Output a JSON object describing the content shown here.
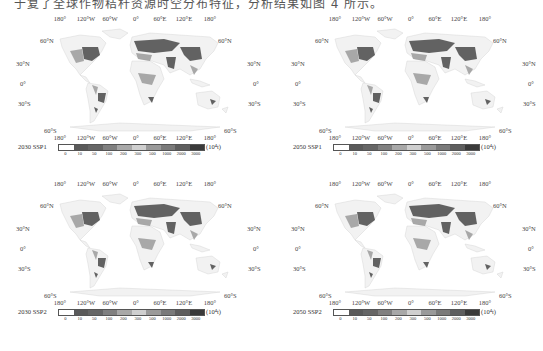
{
  "caption": "于复了全球作物秸秆资源时空分布特征，分析结果如图 4 所示。",
  "lon_labels": [
    "180°",
    "120°W",
    "60°W",
    "0°",
    "60°E",
    "120°E",
    "180°"
  ],
  "lat_labels": [
    "60°N",
    "30°N",
    "0°",
    "30°S",
    "60°S"
  ],
  "legend": {
    "ticks": [
      "0",
      "10",
      "50",
      "100",
      "200",
      "300",
      "500",
      "1000",
      "2000",
      "3000"
    ],
    "unit": "(10⁴t)",
    "colors": [
      "#ffffff",
      "#5a5a5a",
      "#666666",
      "#808080",
      "#a8a8a8",
      "#cfcfcf",
      "#9a9a9a",
      "#7a7a7a",
      "#5e5e5e",
      "#3a3a3a"
    ]
  },
  "panels": [
    {
      "label": "2030 SSP1"
    },
    {
      "label": "2050 SSP1"
    },
    {
      "label": "2030 SSP2"
    },
    {
      "label": "2050 SSP2"
    }
  ],
  "chart_data": [
    {
      "type": "heatmap",
      "title": "2030 SSP1",
      "xlabel": "Longitude",
      "ylabel": "Latitude",
      "x_ticks": [
        "180°",
        "120°W",
        "60°W",
        "0°",
        "60°E",
        "120°E",
        "180°"
      ],
      "y_ticks": [
        "60°N",
        "30°N",
        "0°",
        "30°S",
        "60°S"
      ],
      "colorbar_bins": [
        0,
        10,
        50,
        100,
        200,
        300,
        500,
        1000,
        2000,
        3000
      ],
      "colorbar_unit": "10⁴t"
    },
    {
      "type": "heatmap",
      "title": "2050 SSP1",
      "xlabel": "Longitude",
      "ylabel": "Latitude",
      "x_ticks": [
        "180°",
        "120°W",
        "60°W",
        "0°",
        "60°E",
        "120°E",
        "180°"
      ],
      "y_ticks": [
        "60°N",
        "30°N",
        "0°",
        "30°S",
        "60°S"
      ],
      "colorbar_bins": [
        0,
        10,
        50,
        100,
        200,
        300,
        500,
        1000,
        2000,
        3000
      ],
      "colorbar_unit": "10⁴t"
    },
    {
      "type": "heatmap",
      "title": "2030 SSP2",
      "xlabel": "Longitude",
      "ylabel": "Latitude",
      "x_ticks": [
        "180°",
        "120°W",
        "60°W",
        "0°",
        "60°E",
        "120°E",
        "180°"
      ],
      "y_ticks": [
        "60°N",
        "30°N",
        "0°",
        "30°S",
        "60°S"
      ],
      "colorbar_bins": [
        0,
        10,
        50,
        100,
        200,
        300,
        500,
        1000,
        2000,
        3000
      ],
      "colorbar_unit": "10⁴t"
    },
    {
      "type": "heatmap",
      "title": "2050 SSP2",
      "xlabel": "Longitude",
      "ylabel": "Latitude",
      "x_ticks": [
        "180°",
        "120°W",
        "60°W",
        "0°",
        "60°E",
        "120°E",
        "180°"
      ],
      "y_ticks": [
        "60°N",
        "30°N",
        "0°",
        "30°S",
        "60°S"
      ],
      "colorbar_bins": [
        0,
        10,
        50,
        100,
        200,
        300,
        500,
        1000,
        2000,
        3000
      ],
      "colorbar_unit": "10⁴t"
    }
  ]
}
